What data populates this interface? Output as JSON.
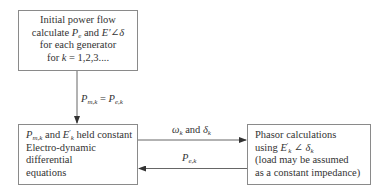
{
  "diagram": {
    "nodes": [
      {
        "id": "initial-power-flow",
        "lines": [
          "Initial power flow",
          "calculate P_e and E′∠δ",
          "for each generator",
          "for k = 1,2,3...."
        ],
        "parts": {
          "l1": "Initial power flow",
          "l2a": "calculate ",
          "l2b": "P",
          "l2c": "e",
          "l2d": " and ",
          "l2e": "E′∠δ",
          "l3": "for each generator",
          "l4a": "for ",
          "l4b": "k",
          "l4c": " = 1,2,3...."
        }
      },
      {
        "id": "electro-dynamic-equations",
        "lines": [
          "P_m,k and E′_k held constant",
          "Electro-dynamic",
          "differential",
          "equations"
        ],
        "parts": {
          "l1a": "P",
          "l1b": "m,k",
          "l1c": " and ",
          "l1d": "E",
          "l1e": "′",
          "l1f": "k",
          "l1g": " held constant",
          "l2": "Electro-dynamic",
          "l3": "differential",
          "l4": "equations"
        }
      },
      {
        "id": "phasor-calculations",
        "lines": [
          "Phasor calculations",
          "using E′_k∠δ_k",
          "(load may be assumed",
          "as a constant impedance)"
        ],
        "parts": {
          "l1": "Phasor calculations",
          "l2a": "using ",
          "l2b": "E",
          "l2c": "′",
          "l2d": "k",
          "l2e": " ∠ δ",
          "l2f": "k",
          "l3": "(load may be assumed",
          "l4": "as a constant impedance)"
        }
      }
    ],
    "edges": [
      {
        "from": "initial-power-flow",
        "to": "electro-dynamic-equations",
        "label": "P_m,k = P_e,k",
        "parts": {
          "a": "P",
          "b": "m,k",
          "c": " = ",
          "d": "P",
          "e": "e,k"
        }
      },
      {
        "from": "electro-dynamic-equations",
        "to": "phasor-calculations",
        "label": "ω_k and δ_k",
        "parts": {
          "a": "ω",
          "b": "k",
          "c": " and ",
          "d": "δ",
          "e": "k"
        }
      },
      {
        "from": "phasor-calculations",
        "to": "electro-dynamic-equations",
        "label": "P_e,k",
        "parts": {
          "a": "P",
          "b": "e,k"
        }
      }
    ],
    "colors": {
      "stroke": "#8a8a8a",
      "text": "#333333",
      "background": "#ffffff"
    }
  }
}
